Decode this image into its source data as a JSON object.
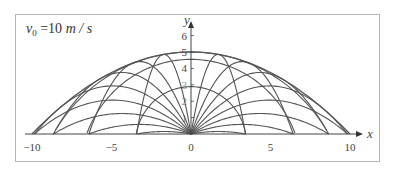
{
  "chart_data": {
    "type": "line",
    "title_parts": {
      "symbol": "v",
      "subscript": "0",
      "rest": " = 10 m / s"
    },
    "xlabel": "x",
    "ylabel": "y",
    "xlim": [
      -11,
      10.5
    ],
    "ylim": [
      0,
      6.5
    ],
    "x_ticks": [
      -10,
      -5,
      0,
      5,
      10
    ],
    "x_tick_labels": [
      "-10",
      "-5",
      "0",
      "5",
      "10"
    ],
    "y_ticks": [
      1,
      2,
      3,
      4,
      5,
      6
    ],
    "y_tick_labels": [
      "1",
      "2",
      "3",
      "4",
      "5",
      "6"
    ],
    "grid": false,
    "legend": null,
    "physics": {
      "v0": 10,
      "g": 10
    },
    "series": [
      {
        "name": "trajectories",
        "kind": "projectile",
        "launch_angles_deg": [
          10,
          20,
          30,
          40,
          50,
          60,
          70,
          80,
          100,
          110,
          120,
          130,
          140,
          150,
          160,
          170
        ]
      },
      {
        "name": "envelope",
        "kind": "parabola",
        "equation": "y = 5 - x^2/20",
        "peak": [
          0,
          5
        ],
        "roots": [
          -10,
          10
        ]
      },
      {
        "name": "isochrones",
        "kind": "circles",
        "times_s": [
          0.35,
          0.7,
          1.0
        ]
      }
    ]
  }
}
